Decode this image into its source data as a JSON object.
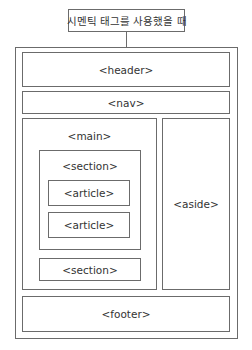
{
  "diagram": {
    "title": "시멘틱 태그를 사용했을 때",
    "elements": {
      "header": "<header>",
      "nav": "<nav>",
      "main": "<main>",
      "section1": "<section>",
      "article1": "<article>",
      "article2": "<article>",
      "section2": "<section>",
      "aside": "<aside>",
      "footer": "<footer>"
    },
    "colors": {
      "border": "#6b6b6b",
      "text": "#333333",
      "background": "#ffffff"
    }
  }
}
